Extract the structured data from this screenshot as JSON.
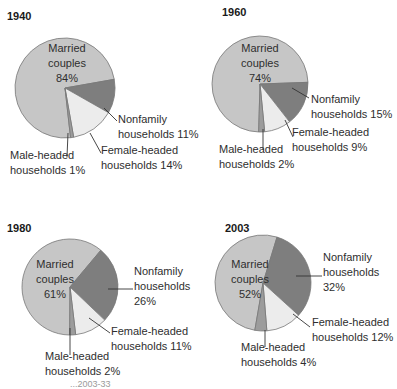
{
  "colors": {
    "married": "#c6c6c6",
    "nonfamily": "#7e7e7e",
    "female": "#ececec",
    "male": "#9c9c9c",
    "outline": "#777777",
    "leader": "#333333"
  },
  "caption": "...2003-33",
  "chart_data": [
    {
      "type": "pie",
      "title": "1940",
      "categories": [
        "Married couples",
        "Nonfamily households",
        "Female-headed households",
        "Male-headed households"
      ],
      "values": [
        84,
        11,
        14,
        1
      ],
      "unit": "%"
    },
    {
      "type": "pie",
      "title": "1960",
      "categories": [
        "Married couples",
        "Nonfamily households",
        "Female-headed households",
        "Male-headed households"
      ],
      "values": [
        74,
        15,
        9,
        2
      ],
      "unit": "%"
    },
    {
      "type": "pie",
      "title": "1980",
      "categories": [
        "Married couples",
        "Nonfamily households",
        "Female-headed households",
        "Male-headed households"
      ],
      "values": [
        61,
        26,
        11,
        2
      ],
      "unit": "%"
    },
    {
      "type": "pie",
      "title": "2003",
      "categories": [
        "Married couples",
        "Nonfamily households",
        "Female-headed households",
        "Male-headed households"
      ],
      "values": [
        52,
        32,
        12,
        4
      ],
      "unit": "%"
    }
  ],
  "pies": [
    {
      "year": "1940",
      "cx": 65,
      "cy": 88,
      "r": 50,
      "start": 80,
      "year_pos": [
        7,
        10
      ],
      "married": {
        "l1": "Married",
        "l2": "couples",
        "l3": "84%",
        "x": 67,
        "y": 47
      },
      "nonfamily": {
        "l1": "Nonfamily",
        "l2": "households 11%",
        "x": 118,
        "y": 117,
        "line": [
          [
            104,
            108
          ],
          [
            117,
            121
          ]
        ]
      },
      "female": {
        "l1": "Female-headed",
        "l2": "households 14%",
        "x": 101,
        "y": 149,
        "line": [
          [
            90,
            133
          ],
          [
            101,
            153
          ]
        ]
      },
      "male": {
        "l1": "Male-headed",
        "l2": "households 1%",
        "x": 10,
        "y": 154,
        "line": [
          [
            68,
            133
          ],
          [
            67,
            157
          ]
        ]
      }
    },
    {
      "year": "1960",
      "cx": 260,
      "cy": 84,
      "r": 48,
      "start": 88,
      "year_pos": [
        222,
        10
      ],
      "married": {
        "l1": "Married",
        "l2": "couples",
        "l3": "74%",
        "x": 262,
        "y": 47
      },
      "nonfamily": {
        "l1": "Nonfamily",
        "l2": "households 15%",
        "x": 311,
        "y": 97,
        "line": [
          [
            292,
            88
          ],
          [
            309,
            98
          ]
        ]
      },
      "female": {
        "l1": "Female-headed",
        "l2": "households 9%",
        "x": 292,
        "y": 130,
        "line": [
          [
            285,
            120
          ],
          [
            293,
            137
          ]
        ]
      },
      "male": {
        "l1": "Male-headed",
        "l2": "households 2%",
        "x": 219,
        "y": 146,
        "line": [
          [
            263,
            129
          ],
          [
            263,
            150
          ]
        ]
      }
    },
    {
      "year": "1980",
      "cx": 70,
      "cy": 287,
      "r": 48,
      "start": 40,
      "year_pos": [
        7,
        221
      ],
      "married": {
        "l1": "Married",
        "l2": "couples",
        "l3": "61%",
        "x": 55,
        "y": 257
      },
      "nonfamily": {
        "l1": "Nonfamily",
        "l2": "households",
        "l3": "26%",
        "x": 134,
        "y": 266,
        "line": [
          [
            108,
            289
          ],
          [
            133,
            289
          ]
        ]
      },
      "female": {
        "l1": "Female-headed",
        "l2": "households 11%",
        "x": 111,
        "y": 328,
        "line": [
          [
            89,
            318
          ],
          [
            110,
            333
          ]
        ]
      },
      "male": {
        "l1": "Male-headed",
        "l2": "households 2%",
        "x": 45,
        "y": 353,
        "line": [
          [
            70,
            328
          ],
          [
            70,
            355
          ]
        ]
      }
    },
    {
      "year": "2003",
      "cx": 263,
      "cy": 283,
      "r": 48,
      "start": 17,
      "year_pos": [
        225,
        221
      ],
      "married": {
        "l1": "Married",
        "l2": "couples",
        "l3": "52%",
        "x": 250,
        "y": 259
      },
      "nonfamily": {
        "l1": "Nonfamily",
        "l2": "households",
        "l3": "32%",
        "x": 323,
        "y": 254,
        "line": [
          [
            296,
            276
          ],
          [
            322,
            276
          ]
        ]
      },
      "female": {
        "l1": "Female-headed",
        "l2": "households 12%",
        "x": 312,
        "y": 320,
        "line": [
          [
            293,
            314
          ],
          [
            310,
            327
          ]
        ]
      },
      "male": {
        "l1": "Male-headed",
        "l2": "households 4%",
        "x": 241,
        "y": 343,
        "line": [
          [
            265,
            330
          ],
          [
            265,
            347
          ]
        ]
      }
    }
  ]
}
